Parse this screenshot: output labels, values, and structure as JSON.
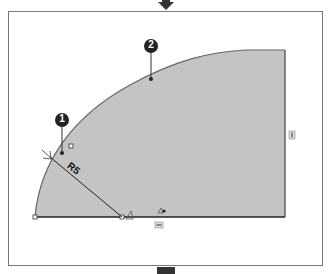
{
  "diagram": {
    "callouts": [
      {
        "id": "1",
        "label": "1"
      },
      {
        "id": "2",
        "label": "2"
      }
    ],
    "dimension": {
      "label": "R5"
    },
    "colors": {
      "fill": "#c4c4c4",
      "stroke": "#555555",
      "frame": "#6f6f6f",
      "callout_bg": "#222222",
      "callout_text": "#ffffff"
    },
    "relations": {
      "horizontal_symbol": "horizontal-relation",
      "vertical_symbol": "vertical-relation",
      "coincident_symbol": "coincident-relation",
      "fixed_symbol": "fixed-relation"
    }
  }
}
